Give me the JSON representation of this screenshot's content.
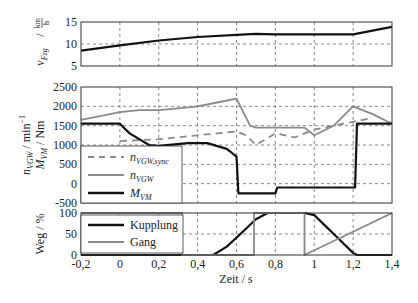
{
  "chart_data": [
    {
      "type": "line",
      "id": "speed",
      "ylabel": "v_Fzg / km/h",
      "ylabel_main": "v",
      "ylabel_sub": "Fzg",
      "ylabel_unit_num": "km",
      "ylabel_unit_den": "h",
      "ylim": [
        5,
        15
      ],
      "yticks": [
        5,
        10,
        15
      ],
      "ytick_labels": [
        "5",
        "10",
        "15"
      ],
      "xlim": [
        -0.2,
        1.4
      ],
      "grid": true,
      "series": [
        {
          "name": "v_Fzg",
          "color": "#111111",
          "x": [
            -0.2,
            0.0,
            0.2,
            0.4,
            0.6,
            0.7,
            0.8,
            1.0,
            1.2,
            1.4
          ],
          "values": [
            8.5,
            9.7,
            10.8,
            11.6,
            12.1,
            12.3,
            12.2,
            12.2,
            12.2,
            13.9
          ]
        }
      ]
    },
    {
      "type": "line",
      "id": "speed_torque",
      "ylabel": "n_VGW / min^-1, M_VM / Nm",
      "ylabel_line1_main": "n",
      "ylabel_line1_sub": "VGW",
      "ylabel_line1_unit": "min",
      "ylabel_line1_exp": "−1",
      "ylabel_line2_main": "M",
      "ylabel_line2_sub": "VM",
      "ylabel_line2_unit": "Nm",
      "ylim": [
        -500,
        2500
      ],
      "yticks": [
        -500,
        0,
        500,
        1000,
        1500,
        2000,
        2500
      ],
      "ytick_labels": [
        "-500",
        "0",
        "500",
        "1000",
        "1500",
        "2000",
        "2500"
      ],
      "xlim": [
        -0.2,
        1.4
      ],
      "grid": true,
      "legend_position": "lower left",
      "legend": [
        {
          "main": "n",
          "sub": "VGW,sync",
          "style": "dashed",
          "color": "#8a8a8a"
        },
        {
          "main": "n",
          "sub": "VGW",
          "style": "solid",
          "color": "#8a8a8a"
        },
        {
          "main": "M",
          "sub": "VM",
          "style": "solid",
          "color": "#111111"
        }
      ],
      "series": [
        {
          "name": "n_VGW,sync",
          "style": "dashed",
          "color": "#8a8a8a",
          "x": [
            0.0,
            0.2,
            0.4,
            0.5,
            0.6,
            0.65,
            0.7,
            0.8,
            0.9,
            1.0,
            1.2,
            1.3
          ],
          "values": [
            1100,
            1150,
            1250,
            1300,
            1350,
            1250,
            1000,
            1300,
            1200,
            1400,
            1600,
            1700
          ]
        },
        {
          "name": "n_VGW",
          "style": "solid",
          "color": "#8a8a8a",
          "x": [
            -0.2,
            0.0,
            0.1,
            0.2,
            0.3,
            0.4,
            0.5,
            0.6,
            0.62,
            0.67,
            0.7,
            0.8,
            0.9,
            0.95,
            1.0,
            1.1,
            1.2,
            1.3,
            1.4
          ],
          "values": [
            1650,
            1850,
            1900,
            1900,
            1950,
            2000,
            2100,
            2200,
            2000,
            1500,
            1450,
            1450,
            1450,
            1450,
            1250,
            1500,
            2000,
            1800,
            1550
          ]
        },
        {
          "name": "M_VM",
          "style": "solid",
          "color": "#111111",
          "x": [
            -0.2,
            0.0,
            0.05,
            0.15,
            0.2,
            0.35,
            0.45,
            0.55,
            0.6,
            0.61,
            0.8,
            0.81,
            1.21,
            1.22,
            1.4
          ],
          "values": [
            1550,
            1550,
            1300,
            1000,
            980,
            1050,
            1050,
            900,
            700,
            -250,
            -250,
            -100,
            -100,
            1550,
            1550
          ]
        }
      ]
    },
    {
      "type": "line",
      "id": "travel",
      "ylabel": "Weg / %",
      "ylim": [
        0,
        100
      ],
      "yticks": [
        0,
        50,
        100
      ],
      "ytick_labels": [
        "0",
        "50",
        "100"
      ],
      "xlim": [
        -0.2,
        1.4
      ],
      "xticks": [
        -0.2,
        0,
        0.2,
        0.4,
        0.6,
        0.8,
        1.0,
        1.2,
        1.4
      ],
      "xtick_labels": [
        "-0,2",
        "0",
        "0,2",
        "0,4",
        "0,6",
        "0,8",
        "1",
        "1,2",
        "1,4"
      ],
      "xlabel": "Zeit / s",
      "grid": true,
      "legend_position": "upper left",
      "legend": [
        {
          "label": "Kupplung",
          "color": "#111111"
        },
        {
          "label": "Gang",
          "color": "#8a8a8a"
        }
      ],
      "series": [
        {
          "name": "Kupplung",
          "color": "#111111",
          "x": [
            -0.2,
            0.48,
            0.55,
            0.62,
            0.7,
            0.76,
            0.95,
            1.0,
            1.1,
            1.2,
            1.22,
            1.4
          ],
          "values": [
            0,
            0,
            20,
            50,
            85,
            100,
            100,
            95,
            50,
            5,
            0,
            0
          ]
        },
        {
          "name": "Gang",
          "color": "#8a8a8a",
          "x": [
            -0.2,
            0.32,
            0.32,
            0.69,
            0.69,
            0.95,
            0.95,
            1.4
          ],
          "values": [
            100,
            100,
            0,
            0,
            100,
            100,
            0,
            100
          ]
        }
      ]
    }
  ],
  "labels": {
    "xlabel": "Zeit / s",
    "legend_kupplung": "Kupplung",
    "legend_gang": "Gang",
    "ylabel_weg": "Weg / %"
  }
}
